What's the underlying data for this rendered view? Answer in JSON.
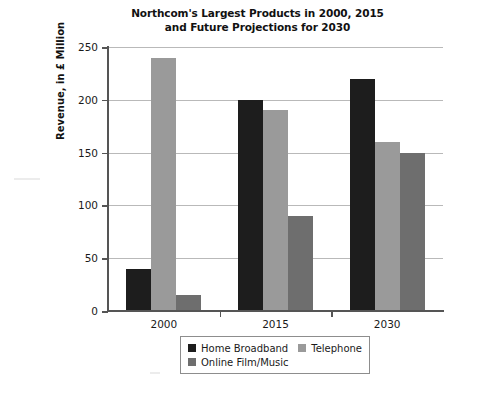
{
  "chart_data": {
    "type": "bar",
    "title": "Northcom's Largest Products in 2000, 2015 and Future Projections for 2030",
    "title_lines": [
      "Northcom's Largest Products in 2000, 2015",
      "and Future Projections for 2030"
    ],
    "xlabel": "",
    "ylabel": "Revenue, in £ Million",
    "categories": [
      "2000",
      "2015",
      "2030"
    ],
    "series": [
      {
        "name": "Home Broadband",
        "values": [
          40,
          200,
          220
        ],
        "color": "#1d1d1d"
      },
      {
        "name": "Telephone",
        "values": [
          240,
          190,
          160
        ],
        "color": "#9a9a9a"
      },
      {
        "name": "Online Film/Music",
        "values": [
          15,
          90,
          150
        ],
        "color": "#6e6e6e"
      }
    ],
    "ylim": [
      0,
      250
    ],
    "ytick_values": [
      0,
      50,
      100,
      150,
      200,
      250
    ],
    "ytick_labels": [
      "0",
      "50",
      "100",
      "150",
      "200",
      "250"
    ],
    "grid": true,
    "grid_axis": "y",
    "legend_position": "bottom-center",
    "legend_entries": [
      {
        "label": "Home Broadband",
        "color": "#1d1d1d"
      },
      {
        "label": "Telephone",
        "color": "#9a9a9a"
      },
      {
        "label": "Online Film/Music",
        "color": "#6e6e6e"
      }
    ]
  }
}
